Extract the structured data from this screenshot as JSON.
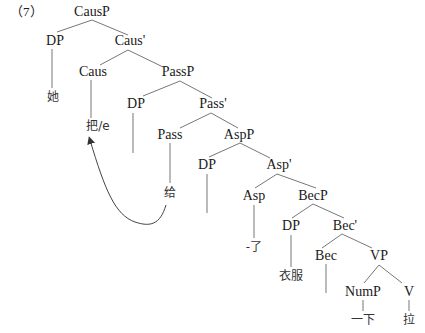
{
  "example_number": "（7）",
  "tree": {
    "nodes": {
      "causp": "CausP",
      "dp1": "DP",
      "caus_bar": "Caus'",
      "caus": "Caus",
      "passp": "PassP",
      "dp2": "DP",
      "pass_bar": "Pass'",
      "pass": "Pass",
      "aspp": "AspP",
      "dp3": "DP",
      "asp_bar": "Asp'",
      "asp": "Asp",
      "becp": "BecP",
      "dp4": "DP",
      "bec_bar": "Bec'",
      "bec": "Bec",
      "vp": "VP",
      "nump": "NumP",
      "v": "V"
    },
    "leaves": {
      "ta": "她",
      "ba_e": "把/e",
      "gei": "给",
      "le": "-了",
      "yifu": "衣服",
      "yixia": "一下",
      "la": "拉"
    },
    "movement_arrow": {
      "from": "给",
      "to": "把/e"
    }
  }
}
